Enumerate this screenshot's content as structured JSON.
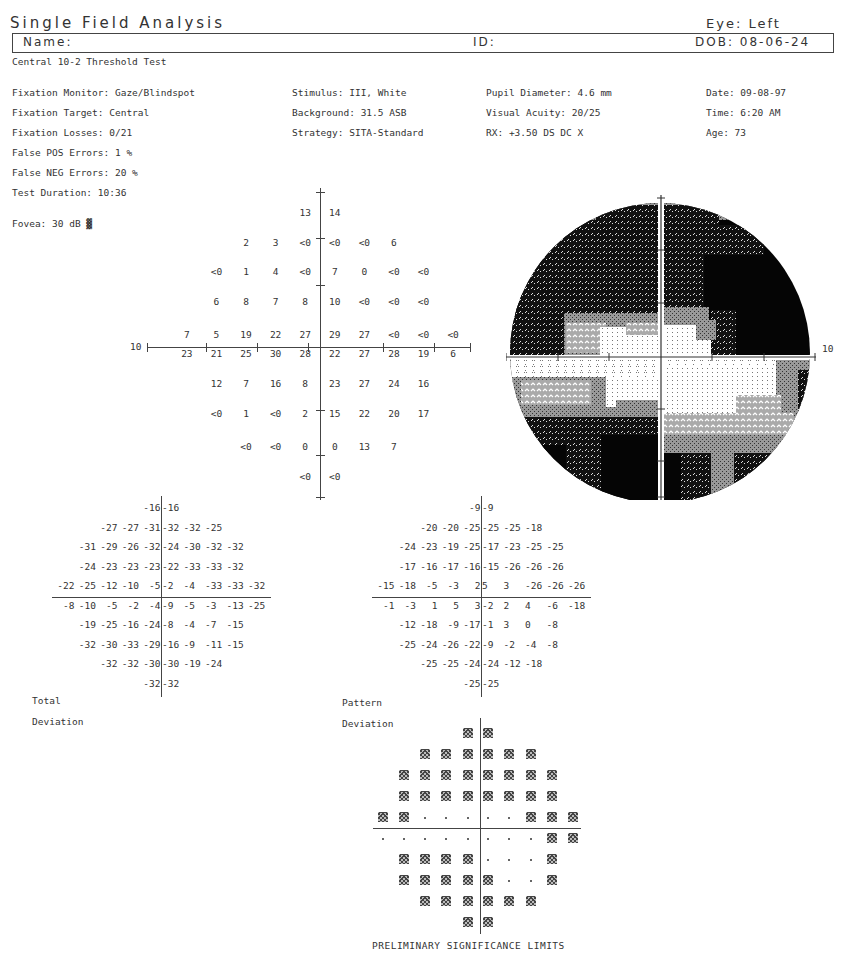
{
  "header": {
    "title": "Single Field Analysis",
    "eye": "Eye: Left",
    "name_label": "Name:",
    "id_label": "ID:",
    "dob": "DOB: 08-06-24",
    "test_name": "Central 10-2 Threshold Test"
  },
  "test_params": {
    "col1": [
      "Fixation Monitor: Gaze/Blindspot",
      "Fixation Target: Central",
      "Fixation Losses: 0/21",
      "False POS Errors:   1 %",
      "False NEG Errors:  20 %",
      "Test Duration: 10:36"
    ],
    "fovea": "Fovea: 30 dB ▓",
    "col2": [
      "Stimulus: III, White",
      "Background: 31.5 ASB",
      "Strategy: SITA-Standard"
    ],
    "col3": [
      "Pupil Diameter: 4.6 mm",
      "Visual Acuity: 20/25",
      "RX: +3.50 DS        DC  X"
    ],
    "col4": [
      "Date: 09-08-97",
      "Time:  6:20 AM",
      "Age: 73"
    ]
  },
  "threshold_plot": {
    "axis_label": "10",
    "rows": [
      [
        "",
        "",
        "",
        "",
        "13",
        "14",
        "",
        "",
        "",
        ""
      ],
      [
        "",
        "",
        "2",
        "3",
        "<0",
        "<0",
        "<0",
        "6",
        "",
        ""
      ],
      [
        "",
        "<0",
        "1",
        "4",
        "<0",
        "7",
        "0",
        "<0",
        "<0",
        ""
      ],
      [
        "",
        "6",
        "8",
        "7",
        "8",
        "10",
        "<0",
        "<0",
        "<0",
        ""
      ],
      [
        "7",
        "5",
        "19",
        "22",
        "27",
        "29",
        "27",
        "<0",
        "<0",
        "<0"
      ],
      [
        "23",
        "21",
        "25",
        "30",
        "28",
        "22",
        "27",
        "28",
        "19",
        "6"
      ],
      [
        "",
        "12",
        "7",
        "16",
        "8",
        "23",
        "27",
        "24",
        "16",
        ""
      ],
      [
        "",
        "<0",
        "1",
        "<0",
        "2",
        "15",
        "22",
        "20",
        "17",
        ""
      ],
      [
        "",
        "",
        "<0",
        "<0",
        "0",
        "0",
        "13",
        "7",
        "",
        ""
      ],
      [
        "",
        "",
        "",
        "",
        "<0",
        "<0",
        "",
        "",
        "",
        ""
      ]
    ]
  },
  "grayscale_plot": {
    "axis_label": "10"
  },
  "total_deviation": {
    "label_line1": "Total",
    "label_line2": "Deviation",
    "rows": [
      [
        "",
        "",
        "",
        "",
        "-16",
        "-16",
        "",
        "",
        "",
        ""
      ],
      [
        "",
        "",
        "-27",
        "-27",
        "-31",
        "-32",
        "-32",
        "-25",
        "",
        ""
      ],
      [
        "",
        "-31",
        "-29",
        "-26",
        "-32",
        "-24",
        "-30",
        "-32",
        "-32",
        ""
      ],
      [
        "",
        "-24",
        "-23",
        "-23",
        "-23",
        "-22",
        "-33",
        "-33",
        "-32",
        ""
      ],
      [
        "-22",
        "-25",
        "-12",
        "-10",
        "-5",
        "-2",
        "-4",
        "-33",
        "-33",
        "-32"
      ],
      [
        "-8",
        "-10",
        "-5",
        "-2",
        "-4",
        "-9",
        "-5",
        "-3",
        "-13",
        "-25"
      ],
      [
        "",
        "-19",
        "-25",
        "-16",
        "-24",
        "-8",
        "-4",
        "-7",
        "-15",
        ""
      ],
      [
        "",
        "-32",
        "-30",
        "-33",
        "-29",
        "-16",
        "-9",
        "-11",
        "-15",
        ""
      ],
      [
        "",
        "",
        "-32",
        "-32",
        "-30",
        "-30",
        "-19",
        "-24",
        "",
        ""
      ],
      [
        "",
        "",
        "",
        "",
        "-32",
        "-32",
        "",
        "",
        "",
        ""
      ]
    ]
  },
  "pattern_deviation": {
    "label_line1": "Pattern",
    "label_line2": "Deviation",
    "rows": [
      [
        "",
        "",
        "",
        "",
        "-9",
        "-9",
        "",
        "",
        "",
        ""
      ],
      [
        "",
        "",
        "-20",
        "-20",
        "-25",
        "-25",
        "-25",
        "-18",
        "",
        ""
      ],
      [
        "",
        "-24",
        "-23",
        "-19",
        "-25",
        "-17",
        "-23",
        "-25",
        "-25",
        ""
      ],
      [
        "",
        "-17",
        "-16",
        "-17",
        "-16",
        "-15",
        "-26",
        "-26",
        "-26",
        ""
      ],
      [
        "-15",
        "-18",
        "-5",
        "-3",
        "2",
        "5",
        "3",
        "-26",
        "-26",
        "-26"
      ],
      [
        "-1",
        "-3",
        "1",
        "5",
        "3",
        "-2",
        "2",
        "4",
        "-6",
        "-18"
      ],
      [
        "",
        "-12",
        "-18",
        "-9",
        "-17",
        "-1",
        "3",
        "0",
        "-8",
        ""
      ],
      [
        "",
        "-25",
        "-24",
        "-26",
        "-22",
        "-9",
        "-2",
        "-4",
        "-8",
        ""
      ],
      [
        "",
        "",
        "-25",
        "-25",
        "-24",
        "-24",
        "-12",
        "-18",
        "",
        ""
      ],
      [
        "",
        "",
        "",
        "",
        "-25",
        "-25",
        "",
        "",
        "",
        ""
      ]
    ]
  },
  "pattern_probability": {
    "legend": "PRELIMINARY SIGNIFICANCE LIMITS",
    "rows": [
      [
        " ",
        " ",
        " ",
        " ",
        "S",
        "S",
        " ",
        " ",
        " ",
        " "
      ],
      [
        " ",
        " ",
        "S",
        "S",
        "S",
        "S",
        "S",
        "S",
        " ",
        " "
      ],
      [
        " ",
        "S",
        "S",
        "S",
        "S",
        "S",
        "S",
        "S",
        "S",
        " "
      ],
      [
        " ",
        "S",
        "S",
        "S",
        "S",
        "S",
        "S",
        "S",
        "S",
        " "
      ],
      [
        "S",
        "S",
        ".",
        ".",
        ".",
        ".",
        ".",
        "S",
        "S",
        "S"
      ],
      [
        ".",
        ".",
        ".",
        ".",
        ".",
        ".",
        ".",
        ".",
        "S",
        "S"
      ],
      [
        " ",
        "S",
        "S",
        "S",
        "S",
        ".",
        ".",
        ".",
        "S",
        " "
      ],
      [
        " ",
        "S",
        "S",
        "S",
        "S",
        "S",
        ".",
        ".",
        "S",
        " "
      ],
      [
        " ",
        " ",
        "S",
        "S",
        "S",
        "S",
        "S",
        "S",
        " ",
        " "
      ],
      [
        " ",
        " ",
        " ",
        " ",
        "S",
        "S",
        " ",
        " ",
        " ",
        " "
      ]
    ]
  }
}
